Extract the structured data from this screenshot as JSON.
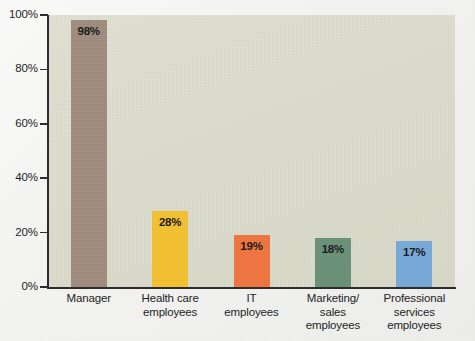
{
  "chart_data": {
    "type": "bar",
    "title": "",
    "subtitle": "",
    "xlabel": "",
    "ylabel": "",
    "ylim": [
      0,
      100
    ],
    "grid": false,
    "legend": null,
    "y_ticks": [
      "0%",
      "20%",
      "40%",
      "60%",
      "80%",
      "100%"
    ],
    "y_tick_values": [
      0,
      20,
      40,
      60,
      80,
      100
    ],
    "categories": [
      "Manager",
      "Health care employees",
      "IT employees",
      "Marketing/ sales employees",
      "Professional services employees"
    ],
    "category_lines": [
      [
        "Manager"
      ],
      [
        "Health care",
        "employees"
      ],
      [
        "IT",
        "employees"
      ],
      [
        "Marketing/",
        "sales",
        "employees"
      ],
      [
        "Professional",
        "services",
        "employees"
      ]
    ],
    "values": [
      98,
      28,
      19,
      18,
      17
    ],
    "value_labels": [
      "98%",
      "28%",
      "19%",
      "18%",
      "17%"
    ],
    "bar_colors": [
      "#a18d7f",
      "#f5c231",
      "#f07540",
      "#6b9178",
      "#78aad8"
    ],
    "plot_background": "#dfe0d0",
    "page_background": "#f4f4f2",
    "axis_color": "#2c2c2c",
    "text_color": "#1d1d1d"
  }
}
